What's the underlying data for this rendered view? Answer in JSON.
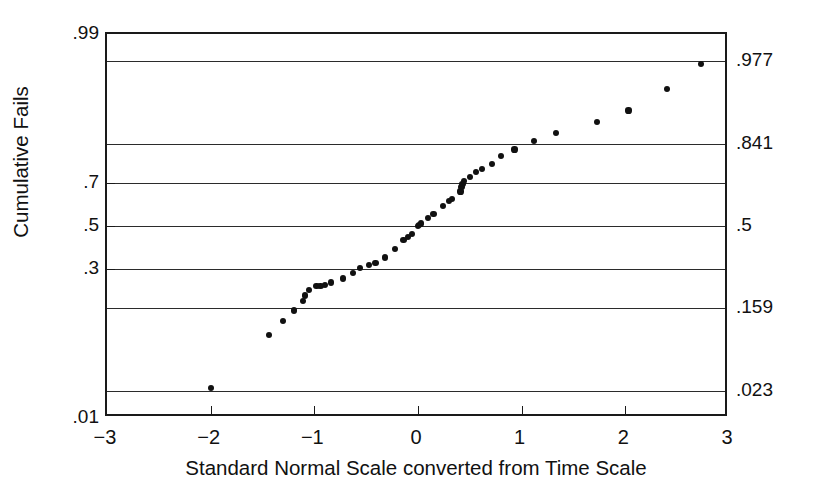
{
  "chart_data": {
    "type": "scatter",
    "title": "",
    "xlabel": "Standard Normal Scale converted from Time Scale",
    "ylabel": "Cumulative Fails",
    "xlim": [
      -3,
      3
    ],
    "ylim_probability": [
      0.01,
      0.99
    ],
    "grid": true,
    "legend": "none",
    "scale_note": "Y axis is a normal-probability scale; gridlines at .977, .841, .5, .159, .023 (integer z) and labelled ticks at .99, .7, .5, .3, .01",
    "xticks": [
      -3,
      -2,
      -1,
      0,
      1,
      2,
      3
    ],
    "xticklabels": [
      "-3",
      "-2",
      "-1",
      "0",
      "1",
      "2",
      "3"
    ],
    "yticks_left": [
      0.99,
      0.7,
      0.5,
      0.3,
      0.01
    ],
    "yticklabels_left": [
      ".99",
      ".7",
      ".5",
      ".3",
      ".01"
    ],
    "yticks_right": [
      0.977,
      0.841,
      0.5,
      0.159,
      0.023
    ],
    "yticklabels_right": [
      ".977",
      ".841",
      ".5",
      ".159",
      ".023"
    ],
    "gridline_values": [
      0.99,
      0.977,
      0.841,
      0.7,
      0.5,
      0.3,
      0.159,
      0.023,
      0.01
    ],
    "series": [
      {
        "name": "Cumulative fails",
        "marker": "filled-circle",
        "color": "#111111",
        "points": [
          {
            "x": -2.0,
            "y": 0.025
          },
          {
            "x": -1.44,
            "y": 0.093
          },
          {
            "x": -1.3,
            "y": 0.124
          },
          {
            "x": -1.2,
            "y": 0.153
          },
          {
            "x": -1.11,
            "y": 0.183
          },
          {
            "x": -1.09,
            "y": 0.2
          },
          {
            "x": -1.05,
            "y": 0.219
          },
          {
            "x": -0.98,
            "y": 0.233
          },
          {
            "x": -0.94,
            "y": 0.235
          },
          {
            "x": -0.9,
            "y": 0.237
          },
          {
            "x": -0.84,
            "y": 0.247
          },
          {
            "x": -0.72,
            "y": 0.262
          },
          {
            "x": -0.63,
            "y": 0.286
          },
          {
            "x": -0.56,
            "y": 0.305
          },
          {
            "x": -0.47,
            "y": 0.318
          },
          {
            "x": -0.41,
            "y": 0.328
          },
          {
            "x": -0.32,
            "y": 0.351
          },
          {
            "x": -0.22,
            "y": 0.391
          },
          {
            "x": -0.14,
            "y": 0.431
          },
          {
            "x": -0.1,
            "y": 0.448
          },
          {
            "x": -0.06,
            "y": 0.462
          },
          {
            "x": 0.0,
            "y": 0.5
          },
          {
            "x": 0.01,
            "y": 0.506
          },
          {
            "x": 0.03,
            "y": 0.512
          },
          {
            "x": 0.1,
            "y": 0.538
          },
          {
            "x": 0.15,
            "y": 0.559
          },
          {
            "x": 0.24,
            "y": 0.595
          },
          {
            "x": 0.3,
            "y": 0.618
          },
          {
            "x": 0.33,
            "y": 0.63
          },
          {
            "x": 0.41,
            "y": 0.662
          },
          {
            "x": 0.42,
            "y": 0.681
          },
          {
            "x": 0.43,
            "y": 0.696
          },
          {
            "x": 0.44,
            "y": 0.708
          },
          {
            "x": 0.5,
            "y": 0.723
          },
          {
            "x": 0.56,
            "y": 0.743
          },
          {
            "x": 0.62,
            "y": 0.756
          },
          {
            "x": 0.71,
            "y": 0.774
          },
          {
            "x": 0.8,
            "y": 0.801
          },
          {
            "x": 0.93,
            "y": 0.823
          },
          {
            "x": 1.12,
            "y": 0.849
          },
          {
            "x": 1.33,
            "y": 0.871
          },
          {
            "x": 1.73,
            "y": 0.897
          },
          {
            "x": 2.03,
            "y": 0.919
          },
          {
            "x": 2.4,
            "y": 0.952
          },
          {
            "x": 2.73,
            "y": 0.975
          }
        ]
      }
    ]
  },
  "axis": {
    "x_title": "Standard Normal Scale converted from Time Scale",
    "y_title": "Cumulative Fails"
  }
}
